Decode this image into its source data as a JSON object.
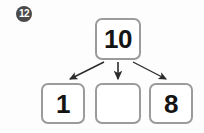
{
  "item": {
    "number": "12",
    "badge_color": "#4a4a4a",
    "badge_text_color": "#ffffff"
  },
  "diagram": {
    "type": "number-bond",
    "box_border_color": "#9b9b9b",
    "arrow_color": "#2b2b2b",
    "total": {
      "label": "10",
      "filled": true
    },
    "parts": [
      {
        "label": "1",
        "filled": true
      },
      {
        "label": "",
        "filled": false
      },
      {
        "label": "8",
        "filled": true
      }
    ]
  }
}
